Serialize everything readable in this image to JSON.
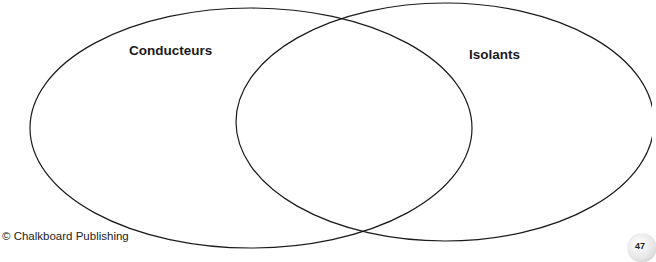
{
  "diagram": {
    "type": "venn",
    "sets": [
      {
        "label": "Conducteurs",
        "cx": 251,
        "cy": 128,
        "rx": 221,
        "ry": 120
      },
      {
        "label": "Isolants",
        "cx": 445,
        "cy": 122,
        "rx": 209,
        "ry": 119
      }
    ],
    "stroke_color": "#1a1a1a"
  },
  "footer": {
    "copyright": "© Chalkboard Publishing",
    "page_number": "47"
  }
}
